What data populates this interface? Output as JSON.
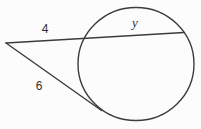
{
  "figure": {
    "type": "geometry-circle-secant-tangent",
    "labels": {
      "secant_external_segment": "4",
      "chord_segment": "y",
      "tangent_segment": "6"
    },
    "colors": {
      "stroke": "#3b3b3b",
      "background": "#fcfcfc",
      "text": "#2e2e2e"
    }
  }
}
